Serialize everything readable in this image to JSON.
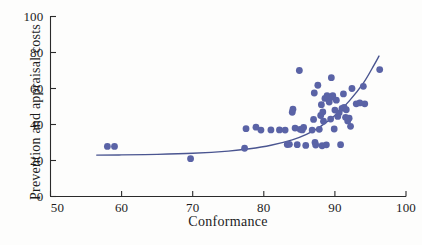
{
  "chart_data": {
    "type": "scatter",
    "title": "",
    "xlabel": "Conformance",
    "ylabel": "Prevention and appraisal costs",
    "xlim": [
      50,
      100
    ],
    "ylim": [
      0,
      100
    ],
    "xticks": [
      50,
      60,
      70,
      80,
      90,
      100
    ],
    "yticks": [
      0,
      20,
      40,
      60,
      80,
      100
    ],
    "grid": false,
    "legend": null,
    "marker_color": "#5a63a6",
    "trend_color": "#4a5590",
    "points": [
      [
        58.0,
        27.8
      ],
      [
        59.0,
        27.8
      ],
      [
        69.7,
        21.0
      ],
      [
        77.3,
        26.8
      ],
      [
        77.5,
        37.7
      ],
      [
        78.9,
        38.5
      ],
      [
        79.6,
        36.9
      ],
      [
        81.0,
        37.0
      ],
      [
        82.2,
        37.0
      ],
      [
        83.0,
        36.9
      ],
      [
        83.3,
        28.9
      ],
      [
        83.6,
        29.0
      ],
      [
        84.0,
        46.8
      ],
      [
        84.1,
        48.5
      ],
      [
        84.4,
        38.0
      ],
      [
        84.7,
        28.8
      ],
      [
        85.0,
        70.0
      ],
      [
        85.1,
        37.3
      ],
      [
        85.4,
        37.0
      ],
      [
        85.6,
        38.4
      ],
      [
        85.9,
        28.4
      ],
      [
        86.8,
        36.9
      ],
      [
        87.0,
        42.8
      ],
      [
        87.1,
        57.5
      ],
      [
        87.2,
        30.0
      ],
      [
        87.3,
        28.6
      ],
      [
        87.6,
        61.8
      ],
      [
        87.8,
        37.3
      ],
      [
        88.0,
        45.0
      ],
      [
        88.1,
        51.0
      ],
      [
        88.2,
        28.2
      ],
      [
        88.3,
        47.0
      ],
      [
        88.4,
        41.8
      ],
      [
        88.6,
        54.5
      ],
      [
        88.8,
        28.7
      ],
      [
        88.9,
        56.0
      ],
      [
        89.0,
        55.0
      ],
      [
        89.2,
        52.5
      ],
      [
        89.4,
        43.0
      ],
      [
        89.5,
        66.0
      ],
      [
        89.6,
        55.2
      ],
      [
        89.7,
        56.0
      ],
      [
        89.9,
        37.5
      ],
      [
        90.0,
        48.0
      ],
      [
        90.2,
        53.5
      ],
      [
        90.4,
        44.5
      ],
      [
        90.6,
        46.5
      ],
      [
        90.8,
        28.8
      ],
      [
        91.0,
        49.0
      ],
      [
        91.2,
        57.0
      ],
      [
        91.3,
        49.5
      ],
      [
        91.5,
        44.0
      ],
      [
        91.6,
        48.2
      ],
      [
        91.8,
        42.0
      ],
      [
        92.0,
        43.5
      ],
      [
        92.2,
        39.0
      ],
      [
        92.4,
        60.0
      ],
      [
        93.0,
        51.5
      ],
      [
        93.5,
        52.0
      ],
      [
        94.0,
        61.2
      ],
      [
        94.2,
        51.5
      ],
      [
        96.3,
        70.5
      ]
    ],
    "trend": {
      "description": "exponential fit curve",
      "points": [
        [
          56.5,
          23.0
        ],
        [
          60.0,
          23.1
        ],
        [
          65.0,
          23.4
        ],
        [
          70.0,
          24.0
        ],
        [
          75.0,
          25.2
        ],
        [
          78.0,
          26.5
        ],
        [
          81.0,
          28.5
        ],
        [
          84.0,
          31.5
        ],
        [
          86.0,
          34.5
        ],
        [
          88.0,
          39.0
        ],
        [
          90.0,
          45.0
        ],
        [
          92.0,
          53.0
        ],
        [
          94.0,
          63.0
        ],
        [
          95.5,
          73.0
        ],
        [
          96.2,
          78.0
        ]
      ]
    }
  },
  "axes": {
    "x_tick_labels": [
      "50",
      "60",
      "70",
      "80",
      "90",
      "100"
    ],
    "y_tick_labels": [
      "0",
      "20",
      "40",
      "60",
      "80",
      "100"
    ]
  }
}
